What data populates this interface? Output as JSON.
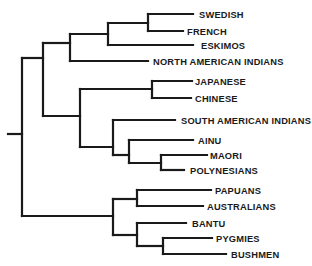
{
  "diagram": {
    "type": "dendrogram",
    "orientation": "left-to-right",
    "line_color": "#1a1a1a",
    "text_color": "#1a1a1a",
    "background": "#ffffff",
    "leaves": [
      {
        "label": "SWEDISH",
        "y": 14,
        "x_end": 193,
        "label_x": 199
      },
      {
        "label": "FRENCH",
        "y": 31,
        "x_end": 183,
        "label_x": 187
      },
      {
        "label": "ESKIMOS",
        "y": 45,
        "x_end": 193,
        "label_x": 201
      },
      {
        "label": "NORTH AMERICAN INDIANS",
        "y": 61,
        "x_end": 148,
        "label_x": 153
      },
      {
        "label": "JAPANESE",
        "y": 81,
        "x_end": 192,
        "label_x": 195
      },
      {
        "label": "CHINESE",
        "y": 98,
        "x_end": 191,
        "label_x": 195
      },
      {
        "label": "SOUTH AMERICAN INDIANS",
        "y": 120,
        "x_end": 175,
        "label_x": 181
      },
      {
        "label": "AINU",
        "y": 140,
        "x_end": 193,
        "label_x": 198
      },
      {
        "label": "MAORI",
        "y": 155,
        "x_end": 207,
        "label_x": 210
      },
      {
        "label": "POLYNESIANS",
        "y": 170,
        "x_end": 184,
        "label_x": 190
      },
      {
        "label": "PAPUANS",
        "y": 190,
        "x_end": 211,
        "label_x": 215
      },
      {
        "label": "AUSTRALIANS",
        "y": 206,
        "x_end": 203,
        "label_x": 207
      },
      {
        "label": "BANTU",
        "y": 223,
        "x_end": 186,
        "label_x": 192
      },
      {
        "label": "PYGMIES",
        "y": 238,
        "x_end": 212,
        "label_x": 216
      },
      {
        "label": "BUSHMEN",
        "y": 254,
        "x_end": 226,
        "label_x": 231
      }
    ],
    "segments": [
      [
        8,
        134,
        22,
        134
      ],
      [
        22,
        58,
        22,
        216
      ],
      [
        22,
        58,
        43,
        58
      ],
      [
        22,
        216,
        113,
        216
      ],
      [
        43,
        43,
        43,
        116
      ],
      [
        43,
        43,
        70,
        43
      ],
      [
        43,
        116,
        80,
        116
      ],
      [
        70,
        34,
        70,
        61
      ],
      [
        70,
        34,
        108,
        34
      ],
      [
        70,
        61,
        148,
        61
      ],
      [
        108,
        23,
        108,
        45
      ],
      [
        108,
        23,
        148,
        23
      ],
      [
        108,
        45,
        193,
        45
      ],
      [
        148,
        14,
        148,
        31
      ],
      [
        148,
        14,
        193,
        14
      ],
      [
        148,
        31,
        183,
        31
      ],
      [
        80,
        89,
        80,
        147
      ],
      [
        80,
        89,
        152,
        89
      ],
      [
        80,
        147,
        113,
        147
      ],
      [
        152,
        81,
        152,
        98
      ],
      [
        152,
        81,
        192,
        81
      ],
      [
        152,
        98,
        191,
        98
      ],
      [
        113,
        120,
        113,
        155
      ],
      [
        113,
        120,
        175,
        120
      ],
      [
        113,
        155,
        129,
        155
      ],
      [
        129,
        140,
        129,
        163
      ],
      [
        129,
        140,
        193,
        140
      ],
      [
        129,
        163,
        161,
        163
      ],
      [
        161,
        155,
        161,
        170
      ],
      [
        161,
        155,
        207,
        155
      ],
      [
        161,
        170,
        184,
        170
      ],
      [
        113,
        199,
        113,
        235
      ],
      [
        113,
        199,
        137,
        199
      ],
      [
        113,
        235,
        137,
        235
      ],
      [
        137,
        190,
        137,
        206
      ],
      [
        137,
        190,
        211,
        190
      ],
      [
        137,
        206,
        203,
        206
      ],
      [
        137,
        223,
        137,
        246
      ],
      [
        137,
        223,
        186,
        223
      ],
      [
        137,
        246,
        163,
        246
      ],
      [
        163,
        238,
        163,
        254
      ],
      [
        163,
        238,
        212,
        238
      ],
      [
        163,
        254,
        226,
        254
      ]
    ]
  }
}
